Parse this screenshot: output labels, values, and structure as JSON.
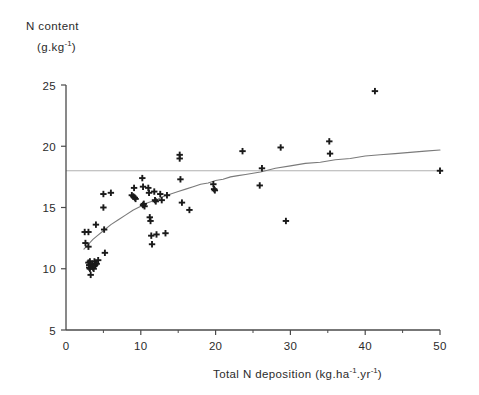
{
  "figure": {
    "background_color": "#ffffff",
    "axis_color": "#4a4a4a",
    "marker_color": "#1a1a1a",
    "curve_color": "#7a7a7a",
    "refline_color": "#b0b0b0"
  },
  "chart_data": {
    "type": "scatter",
    "title": "",
    "subtitle": "",
    "xlabel": "Total N deposition (kg.ha-1.yr-1)",
    "xlabel_parts": {
      "main": "Total N deposition (kg.ha",
      "sup1": "-1",
      "mid": ".yr",
      "sup2": "-1",
      "end": ")"
    },
    "ylabel": "N content (g.kg-1)",
    "ylabel_parts": {
      "line1": "N content",
      "line2_main": "(g.kg",
      "line2_sup": "-1",
      "line2_end": ")"
    },
    "xlim": [
      0,
      50
    ],
    "ylim": [
      5,
      25
    ],
    "xticks": [
      0,
      10,
      20,
      30,
      40,
      50
    ],
    "xticklabels": [
      "0",
      "10",
      "20",
      "30",
      "40",
      "50"
    ],
    "xminorticks": [
      5,
      15,
      25,
      35,
      45
    ],
    "yticks": [
      5,
      10,
      15,
      20,
      25
    ],
    "yticklabels": [
      "5",
      "10",
      "15",
      "20",
      "25"
    ],
    "grid": false,
    "legend": null,
    "marker": "plus",
    "reference_line": {
      "orientation": "horizontal",
      "y": 18,
      "color": "#b0b0b0",
      "label": ""
    },
    "fit_curve": {
      "name": "fitted saturating curve",
      "color": "#7a7a7a",
      "x": [
        2.4,
        3.0,
        3.6,
        4.2,
        5.0,
        6.0,
        7.0,
        8.0,
        9.0,
        10.0,
        11.0,
        12.0,
        13.0,
        14.0,
        15.0,
        16.0,
        17.0,
        18.0,
        19.0,
        20.0,
        21.0,
        22.0,
        23.0,
        24.0,
        25.0,
        26.0,
        28.0,
        30.0,
        32.0,
        34.0,
        36.0,
        38.0,
        40.0,
        42.0,
        44.0,
        46.0,
        48.0,
        50.0
      ],
      "y": [
        11.6,
        12.0,
        12.4,
        12.7,
        13.1,
        13.6,
        14.0,
        14.4,
        14.8,
        15.1,
        15.4,
        15.6,
        15.9,
        16.1,
        16.3,
        16.5,
        16.7,
        16.9,
        17.0,
        17.2,
        17.3,
        17.5,
        17.6,
        17.7,
        17.8,
        17.9,
        18.2,
        18.4,
        18.6,
        18.7,
        18.9,
        19.0,
        19.2,
        19.3,
        19.4,
        19.5,
        19.6,
        19.7
      ]
    },
    "points": [
      {
        "x": 2.5,
        "y": 13.0
      },
      {
        "x": 2.6,
        "y": 12.1
      },
      {
        "x": 3.0,
        "y": 13.0
      },
      {
        "x": 3.0,
        "y": 11.8
      },
      {
        "x": 3.0,
        "y": 10.5
      },
      {
        "x": 3.1,
        "y": 10.3
      },
      {
        "x": 3.1,
        "y": 10.1
      },
      {
        "x": 3.2,
        "y": 10.0
      },
      {
        "x": 3.2,
        "y": 10.6
      },
      {
        "x": 3.3,
        "y": 9.5
      },
      {
        "x": 3.4,
        "y": 10.2
      },
      {
        "x": 3.5,
        "y": 10.4
      },
      {
        "x": 3.6,
        "y": 10.1
      },
      {
        "x": 3.7,
        "y": 10.0
      },
      {
        "x": 3.8,
        "y": 10.6
      },
      {
        "x": 3.9,
        "y": 10.3
      },
      {
        "x": 4.0,
        "y": 13.6
      },
      {
        "x": 4.1,
        "y": 10.4
      },
      {
        "x": 4.3,
        "y": 10.7
      },
      {
        "x": 5.0,
        "y": 16.1
      },
      {
        "x": 5.0,
        "y": 15.0
      },
      {
        "x": 5.1,
        "y": 13.2
      },
      {
        "x": 5.2,
        "y": 11.3
      },
      {
        "x": 6.0,
        "y": 16.2
      },
      {
        "x": 8.8,
        "y": 16.0
      },
      {
        "x": 9.0,
        "y": 15.9
      },
      {
        "x": 9.1,
        "y": 16.6
      },
      {
        "x": 9.2,
        "y": 15.8
      },
      {
        "x": 9.3,
        "y": 15.7
      },
      {
        "x": 10.2,
        "y": 17.4
      },
      {
        "x": 10.3,
        "y": 16.7
      },
      {
        "x": 10.3,
        "y": 15.2
      },
      {
        "x": 10.4,
        "y": 15.3
      },
      {
        "x": 10.5,
        "y": 15.1
      },
      {
        "x": 11.0,
        "y": 16.6
      },
      {
        "x": 11.1,
        "y": 16.2
      },
      {
        "x": 11.2,
        "y": 14.2
      },
      {
        "x": 11.3,
        "y": 13.9
      },
      {
        "x": 11.4,
        "y": 12.7
      },
      {
        "x": 11.5,
        "y": 12.0
      },
      {
        "x": 11.8,
        "y": 16.3
      },
      {
        "x": 11.9,
        "y": 15.6
      },
      {
        "x": 12.0,
        "y": 15.5
      },
      {
        "x": 12.1,
        "y": 12.8
      },
      {
        "x": 12.6,
        "y": 16.1
      },
      {
        "x": 12.8,
        "y": 15.6
      },
      {
        "x": 13.3,
        "y": 12.9
      },
      {
        "x": 13.5,
        "y": 16.0
      },
      {
        "x": 15.2,
        "y": 19.3
      },
      {
        "x": 15.2,
        "y": 19.0
      },
      {
        "x": 15.3,
        "y": 17.3
      },
      {
        "x": 15.5,
        "y": 15.4
      },
      {
        "x": 16.5,
        "y": 14.8
      },
      {
        "x": 19.7,
        "y": 16.9
      },
      {
        "x": 19.8,
        "y": 16.5
      },
      {
        "x": 19.9,
        "y": 16.4
      },
      {
        "x": 23.6,
        "y": 19.6
      },
      {
        "x": 25.9,
        "y": 16.8
      },
      {
        "x": 26.2,
        "y": 18.2
      },
      {
        "x": 28.7,
        "y": 19.9
      },
      {
        "x": 29.4,
        "y": 13.9
      },
      {
        "x": 35.2,
        "y": 20.4
      },
      {
        "x": 35.3,
        "y": 19.4
      },
      {
        "x": 41.3,
        "y": 24.5
      },
      {
        "x": 50.0,
        "y": 18.0
      }
    ]
  }
}
